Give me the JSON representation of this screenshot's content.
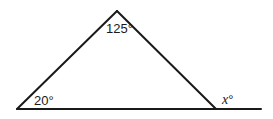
{
  "diagram": {
    "type": "triangle-exterior-angle",
    "vertices": {
      "apex": {
        "x": 117,
        "y": 11
      },
      "bottom_left": {
        "x": 17,
        "y": 109
      },
      "bottom_right": {
        "x": 216,
        "y": 109
      }
    },
    "base_extension_end": {
      "x": 261,
      "y": 109
    },
    "labels": {
      "apex_angle": "125°",
      "left_angle": "20°",
      "exterior_angle": "x°",
      "exterior_var": "x",
      "degree": "°"
    },
    "colors": {
      "line": "#1a1a1a",
      "background": "#ffffff"
    }
  }
}
